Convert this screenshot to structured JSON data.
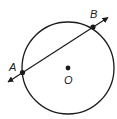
{
  "diagram": {
    "type": "circle-with-secant",
    "colors": {
      "stroke": "#1a1a1a",
      "background": "#ffffff",
      "label": "#222222"
    },
    "circle": {
      "cx": 68,
      "cy": 68,
      "r": 46,
      "center_label": "O"
    },
    "points": [
      {
        "id": "A",
        "label": "A",
        "x": 22.5,
        "y": 72.5,
        "label_x": 9,
        "label_y": 71
      },
      {
        "id": "B",
        "label": "B",
        "x": 93,
        "y": 27,
        "label_x": 90,
        "label_y": 18
      }
    ],
    "center_point": {
      "label": "O",
      "x": 68,
      "y": 68,
      "label_x": 64,
      "label_y": 84
    },
    "line": {
      "through": [
        "A",
        "B"
      ],
      "x1": 8,
      "y1": 82,
      "x2": 108,
      "y2": 17.5,
      "arrows": "both"
    }
  }
}
